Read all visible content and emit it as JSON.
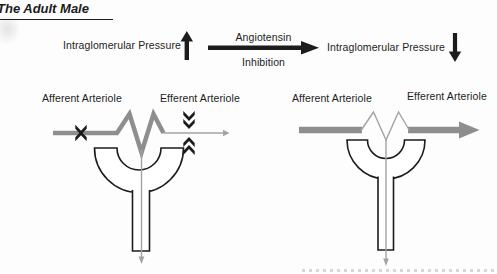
{
  "title": "The Adult Male",
  "flow": {
    "left_label": "Intraglomerular Pressure",
    "center_top_label": "Angiotensin",
    "center_bottom_label": "Inhibition",
    "right_label": "Intraglomerular Pressure"
  },
  "diagrams": {
    "before": {
      "afferent_label": "Afferent Arteriole",
      "efferent_label": "Efferent Arteriole"
    },
    "after": {
      "afferent_label": "Afferent Arteriole",
      "efferent_label": "Efferent Arteriole"
    }
  },
  "icons": {
    "left_arrow": "up-arrow",
    "center_arrow": "right-arrow",
    "right_arrow": "down-arrow",
    "afferent_marker": "x-constriction-mark",
    "efferent_marker": "chevron-constriction-marks",
    "flow_markers": "small-down-arrowheads"
  },
  "colors": {
    "vessel_gray": "#8e8e8e",
    "thin_gray": "#a3a3a3",
    "ink": "#1c1c1c",
    "background": "#fdfdfd"
  }
}
